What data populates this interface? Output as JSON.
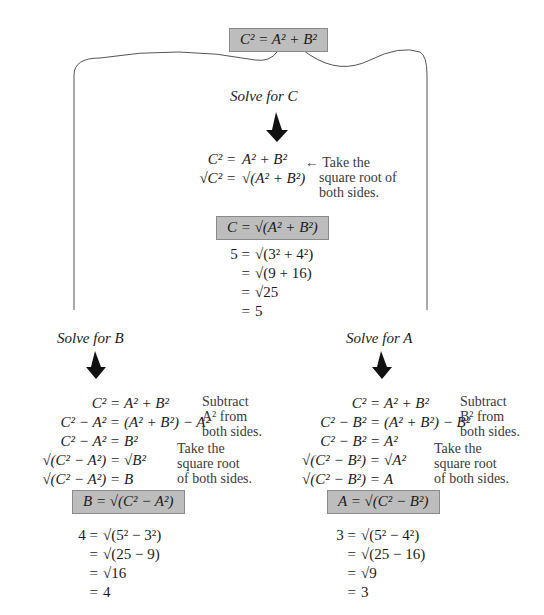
{
  "top_equation": "C² = A² + B²",
  "branches": {
    "c": {
      "label": "Solve for C",
      "steps": [
        {
          "lhs": "C² =",
          "rhs": "A² + B²"
        },
        {
          "lhs": "√C² =",
          "rhs": "√(A² + B²)"
        }
      ],
      "note": [
        "← Take the",
        "square root of",
        "both sides."
      ],
      "result": "C = √(A² + B²)",
      "example": [
        {
          "lhs": "5 =",
          "rhs": "√(3² + 4²)"
        },
        {
          "lhs": "=",
          "rhs": "√(9 + 16)"
        },
        {
          "lhs": "=",
          "rhs": "√25"
        },
        {
          "lhs": "=",
          "rhs": "5"
        }
      ]
    },
    "b": {
      "label": "Solve for B",
      "steps": [
        {
          "lhs": "C² =",
          "rhs": "A² + B²"
        },
        {
          "lhs": "C² − A² =",
          "rhs": "(A² + B²) − A²"
        },
        {
          "lhs": "C² − A² =",
          "rhs": "B²"
        },
        {
          "lhs": "√(C² − A²) =",
          "rhs": "√B²"
        },
        {
          "lhs": "√(C² − A²) =",
          "rhs": "B"
        }
      ],
      "note_subtract": [
        "Subtract",
        "A² from",
        "both sides."
      ],
      "note_root": [
        "Take the",
        "square root",
        "of both sides."
      ],
      "result": "B = √(C² − A²)",
      "example": [
        {
          "lhs": "4 =",
          "rhs": "√(5² − 3²)"
        },
        {
          "lhs": "=",
          "rhs": "√(25 − 9)"
        },
        {
          "lhs": "=",
          "rhs": "√16"
        },
        {
          "lhs": "=",
          "rhs": "4"
        }
      ]
    },
    "a": {
      "label": "Solve for A",
      "steps": [
        {
          "lhs": "C² =",
          "rhs": "A² + B²"
        },
        {
          "lhs": "C² − B² =",
          "rhs": "(A² + B²) − B²"
        },
        {
          "lhs": "C² − B² =",
          "rhs": "A²"
        },
        {
          "lhs": "√(C² − B²) =",
          "rhs": "√A²"
        },
        {
          "lhs": "√(C² − B²) =",
          "rhs": "A"
        }
      ],
      "note_subtract": [
        "Subtract",
        "B² from",
        "both sides."
      ],
      "note_root": [
        "Take the",
        "square root",
        "of both sides."
      ],
      "result": "A = √(C² − B²)",
      "example": [
        {
          "lhs": "3 =",
          "rhs": "√(5² − 4²)"
        },
        {
          "lhs": "=",
          "rhs": "√(25 − 16)"
        },
        {
          "lhs": "=",
          "rhs": "√9"
        },
        {
          "lhs": "=",
          "rhs": "3"
        }
      ]
    }
  }
}
